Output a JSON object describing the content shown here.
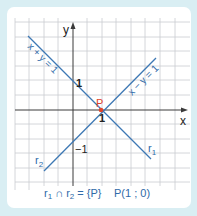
{
  "colors": {
    "background": "#d9eef3",
    "card": "#ffffff",
    "grid": "#c9ccd0",
    "axis": "#3a3a3a",
    "line": "#3d78b4",
    "label_blue": "#2f6aa8",
    "point": "#e0452b",
    "text_dark": "#222222"
  },
  "axes": {
    "x_label": "x",
    "y_label": "y"
  },
  "ticks": {
    "y_pos_one": "1",
    "y_neg_one": "−1",
    "x_one": "1"
  },
  "lines": [
    {
      "id": "r1",
      "equation": "x + y = 1",
      "name": "r",
      "subscript": "1"
    },
    {
      "id": "r2",
      "equation": "x − y = 1",
      "name": "r",
      "subscript": "2"
    }
  ],
  "point": {
    "label": "P"
  },
  "caption": {
    "r1": "r",
    "r1_sub": "1",
    "cap": " ∩ ",
    "r2": "r",
    "r2_sub": "2",
    "eq": " = {P}",
    "coords": "P(1 ; 0)"
  }
}
